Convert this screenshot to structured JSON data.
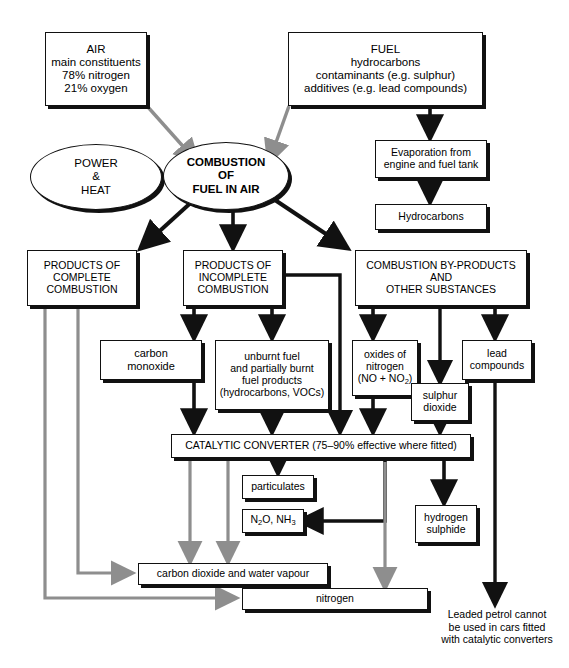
{
  "diagram": {
    "colors": {
      "ink": "#111111",
      "grey_flow": "#8e8e8e",
      "background": "#ffffff"
    },
    "nodes": {
      "air": {
        "lines": [
          "AIR",
          "main constituents",
          "78% nitrogen",
          "21% oxygen"
        ]
      },
      "fuel": {
        "lines": [
          "FUEL",
          "hydrocarbons",
          "contaminants (e.g. sulphur)",
          "additives (e.g. lead compounds)"
        ]
      },
      "power_heat": {
        "lines": [
          "POWER",
          "&",
          "HEAT"
        ]
      },
      "combustion": {
        "lines": [
          "COMBUSTION",
          "OF",
          "FUEL IN AIR"
        ]
      },
      "evaporation": {
        "lines": [
          "Evaporation from",
          "engine and fuel tank"
        ]
      },
      "hydrocarbons": {
        "lines": [
          "Hydrocarbons"
        ]
      },
      "products_complete": {
        "lines": [
          "PRODUCTS OF",
          "COMPLETE",
          "COMBUSTION"
        ]
      },
      "products_incomplete": {
        "lines": [
          "PRODUCTS OF",
          "INCOMPLETE",
          "COMBUSTION"
        ]
      },
      "byproducts": {
        "lines": [
          "COMBUSTION BY-PRODUCTS",
          "AND",
          "OTHER SUBSTANCES"
        ]
      },
      "carbon_monoxide": {
        "lines": [
          "carbon",
          "monoxide"
        ]
      },
      "unburnt_fuel": {
        "lines": [
          "unburnt fuel",
          "and partially burnt",
          "fuel products",
          "(hydrocarbons, VOCs)"
        ]
      },
      "oxides_nitrogen": {
        "lines": [
          "oxides of",
          "nitrogen",
          "(NO + NO2)"
        ]
      },
      "lead_compounds": {
        "lines": [
          "lead",
          "compounds"
        ]
      },
      "sulphur_dioxide": {
        "lines": [
          "sulphur",
          "dioxide"
        ]
      },
      "catalytic_converter": {
        "lines": [
          "CATALYTIC CONVERTER (75–90% effective where fitted)"
        ]
      },
      "particulates": {
        "lines": [
          "particulates"
        ]
      },
      "n2o_nh3": {
        "lines": [
          "N2O, NH3"
        ]
      },
      "hydrogen_sulphide": {
        "lines": [
          "hydrogen",
          "sulphide"
        ]
      },
      "carbon_dioxide_water": {
        "lines": [
          "carbon dioxide and water vapour"
        ]
      },
      "nitrogen": {
        "lines": [
          "nitrogen"
        ]
      },
      "leaded_note": {
        "lines": [
          "Leaded petrol cannot",
          "be used in cars fitted",
          "with catalytic converters"
        ]
      }
    }
  }
}
